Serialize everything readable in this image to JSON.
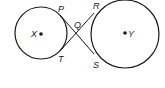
{
  "diagram": {
    "type": "geometry",
    "stroke_color": "#1a1a1a",
    "circles": [
      {
        "name": "X",
        "cx": 41,
        "cy": 33,
        "r": 26,
        "center_label": "X"
      },
      {
        "name": "Y",
        "cx": 125,
        "cy": 34,
        "r": 34,
        "center_label": "Y"
      }
    ],
    "points": {
      "P": {
        "label": "P",
        "x": 60,
        "y": 15
      },
      "T": {
        "label": "T",
        "x": 60,
        "y": 51
      },
      "Q": {
        "label": "Q",
        "x": 77,
        "y": 33
      },
      "R": {
        "label": "R",
        "x": 94,
        "y": 13
      },
      "S": {
        "label": "S",
        "x": 94,
        "y": 54
      }
    },
    "segments": [
      {
        "from": "P",
        "to": "S"
      },
      {
        "from": "T",
        "to": "R"
      }
    ]
  }
}
